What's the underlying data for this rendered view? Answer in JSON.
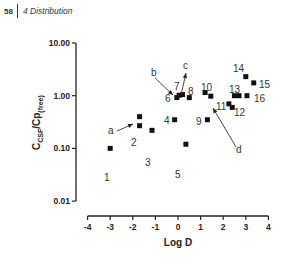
{
  "header": {
    "page_number": "58",
    "chapter": "4 Distribution"
  },
  "chart_data": {
    "type": "scatter",
    "title": "",
    "xlabel": "Log D",
    "ylabel": "C_CSF/Cp(free)",
    "ylabel_main": "C",
    "ylabel_sub1": "CSF",
    "ylabel_mid": "/Cp",
    "ylabel_sub2": "(free)",
    "xlim": [
      -4,
      4
    ],
    "ylim": [
      0.01,
      10
    ],
    "yscale": "log",
    "x_ticks": [
      "-4",
      "-3",
      "-2",
      "-1",
      "0",
      "1",
      "2",
      "3",
      "4"
    ],
    "y_ticks": [
      "10.00",
      "1.00",
      "0.10",
      "0.01"
    ],
    "grid": false,
    "points": [
      {
        "label": "1",
        "x": -3.0,
        "y": 0.1
      },
      {
        "label": "2",
        "x": -1.7,
        "y": 0.4
      },
      {
        "label": "2b",
        "x": -1.7,
        "y": 0.27
      },
      {
        "label": "3",
        "x": -1.15,
        "y": 0.22
      },
      {
        "label": "4",
        "x": -0.15,
        "y": 0.35
      },
      {
        "label": "5",
        "x": 0.35,
        "y": 0.12
      },
      {
        "label": "6",
        "x": -0.05,
        "y": 0.92
      },
      {
        "label": "6b",
        "x": 0.05,
        "y": 1.02
      },
      {
        "label": "7",
        "x": 0.2,
        "y": 1.05
      },
      {
        "label": "8",
        "x": 0.5,
        "y": 0.92
      },
      {
        "label": "9",
        "x": 1.3,
        "y": 0.35
      },
      {
        "label": "10",
        "x": 1.2,
        "y": 1.15
      },
      {
        "label": "10b",
        "x": 1.45,
        "y": 0.98
      },
      {
        "label": "11",
        "x": 2.25,
        "y": 0.7
      },
      {
        "label": "12",
        "x": 2.4,
        "y": 0.6
      },
      {
        "label": "13",
        "x": 2.5,
        "y": 1.0
      },
      {
        "label": "13b",
        "x": 2.7,
        "y": 1.0
      },
      {
        "label": "14",
        "x": 3.0,
        "y": 2.3
      },
      {
        "label": "15",
        "x": 3.35,
        "y": 1.75
      },
      {
        "label": "16",
        "x": 3.05,
        "y": 1.0
      }
    ],
    "point_labels": [
      {
        "text": "1",
        "x": 104,
        "y": 181
      },
      {
        "text": "2",
        "x": 131,
        "y": 146
      },
      {
        "text": "3",
        "x": 145,
        "y": 166
      },
      {
        "text": "4",
        "x": 164,
        "y": 124
      },
      {
        "text": "5",
        "x": 175,
        "y": 178
      },
      {
        "text": "6",
        "x": 165,
        "y": 102
      },
      {
        "text": "7",
        "x": 174,
        "y": 90
      },
      {
        "text": "8",
        "x": 188,
        "y": 95
      },
      {
        "text": "9",
        "x": 196,
        "y": 125
      },
      {
        "text": "10",
        "x": 201,
        "y": 91
      },
      {
        "text": "11",
        "x": 216,
        "y": 110
      },
      {
        "text": "12",
        "x": 234,
        "y": 116
      },
      {
        "text": "13",
        "x": 229,
        "y": 93
      },
      {
        "text": "14",
        "x": 233,
        "y": 72
      },
      {
        "text": "15",
        "x": 259,
        "y": 88
      },
      {
        "text": "16",
        "x": 254,
        "y": 102
      }
    ],
    "annotations": [
      {
        "text": "a",
        "x": 108,
        "y": 134
      },
      {
        "text": "b",
        "x": 151,
        "y": 76
      },
      {
        "text": "c",
        "x": 183,
        "y": 69
      },
      {
        "text": "d",
        "x": 236,
        "y": 153
      }
    ],
    "axis_labels": {
      "x": "Log D"
    }
  }
}
